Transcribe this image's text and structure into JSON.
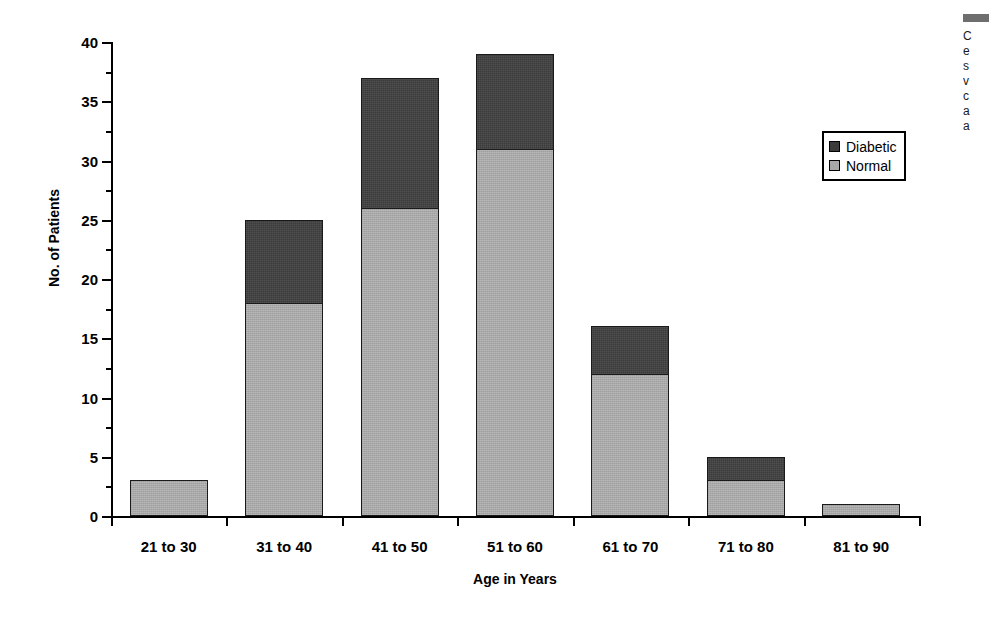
{
  "chart_data": {
    "type": "bar",
    "subtype": "stacked-bar",
    "title": "",
    "xlabel": "Age in Years",
    "ylabel": "No. of Patients",
    "categories": [
      "21 to 30",
      "31 to 40",
      "41 to 50",
      "51 to 60",
      "61 to 70",
      "71 to 80",
      "81 to 90"
    ],
    "series": [
      {
        "name": "Normal",
        "values": [
          3,
          18,
          26,
          31,
          12,
          3,
          1
        ],
        "color": "#a8a8a8"
      },
      {
        "name": "Diabetic",
        "values": [
          0,
          7,
          11,
          8,
          4,
          2,
          0
        ],
        "color": "#3b3b3b"
      }
    ],
    "totals": [
      3,
      25,
      37,
      39,
      16,
      5,
      1
    ],
    "ylim": [
      0,
      40
    ],
    "y_ticks": [
      0,
      5,
      10,
      15,
      20,
      25,
      30,
      35,
      40
    ],
    "y_tick_labels": [
      "0",
      "5",
      "10",
      "15",
      "20",
      "25",
      "30",
      "35",
      "40"
    ],
    "y_minor_tick_interval": 2.5,
    "grid": false,
    "legend_position": "right",
    "stack_order": "normal-bottom-diabetic-top"
  },
  "axes": {
    "y_title": "No. of Patients",
    "x_title": "Age in Years",
    "y_tick_labels": [
      "40",
      "35",
      "30",
      "25",
      "20",
      "15",
      "10",
      "5",
      "0"
    ]
  },
  "legend": {
    "items": [
      {
        "label": "Diabetic",
        "swatch": "diabetic"
      },
      {
        "label": "Normal",
        "swatch": "normal"
      }
    ]
  },
  "caption": {
    "lines": [
      "C",
      "e",
      "s",
      "v",
      "c",
      "a",
      "a"
    ]
  },
  "colors": {
    "diabetic": "#3b3b3b",
    "normal": "#a8a8a8",
    "axis": "#000000",
    "background": "#ffffff"
  }
}
